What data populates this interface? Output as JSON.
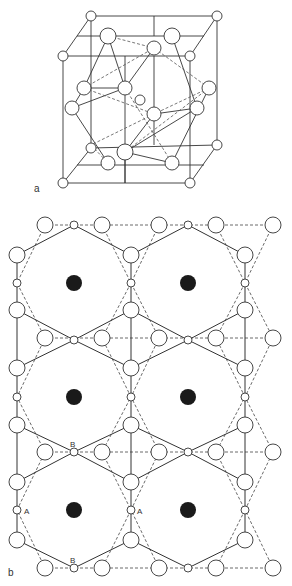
{
  "figure": {
    "panel_a": {
      "label": "a",
      "description": "3D cubic unit cell with corner atoms and interior polyhedron"
    },
    "panel_b": {
      "label": "b",
      "description": "2D projection of hexagonal network with large black cavity centers",
      "site_labels": {
        "A": "A",
        "B": "B"
      }
    }
  },
  "colors": {
    "line": "#333333",
    "atom_fill": "#ffffff",
    "cavity_fill": "#1a1a1a",
    "background": "#ffffff"
  }
}
